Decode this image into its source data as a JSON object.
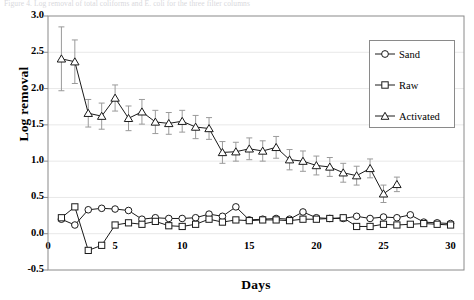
{
  "figure": {
    "top_caption": "Figure 4. Log removal of total coliforms and E. coli for the three filter columns",
    "frame_color": "#8a8a8a",
    "grid": true,
    "grid_color": "#e8e8e8",
    "series_color": "#1a1a1a",
    "errorbar_color": "#9a9a9a"
  },
  "chart_data": {
    "type": "line",
    "title": "",
    "xlabel": "Days",
    "ylabel": "Log removal",
    "xlim": [
      0,
      31
    ],
    "ylim": [
      -0.5,
      3.0
    ],
    "xticks": [
      0,
      5,
      10,
      15,
      20,
      25,
      30
    ],
    "yticks": [
      -0.5,
      0.0,
      0.5,
      1.0,
      1.5,
      2.0,
      2.5,
      3.0
    ],
    "xtick_labels": [
      "0",
      "5",
      "10",
      "15",
      "20",
      "25",
      "30"
    ],
    "ytick_labels": [
      "-0.5",
      "0.0",
      "0.5",
      "1.0",
      "1.5",
      "2.0",
      "2.5",
      "3.0"
    ],
    "grid": true,
    "legend_position": "upper right",
    "legend_entries": [
      {
        "name": "Sand",
        "marker": "circle"
      },
      {
        "name": "Raw",
        "marker": "square"
      },
      {
        "name": "Activated",
        "marker": "triangle"
      }
    ],
    "x": [
      1,
      2,
      3,
      4,
      5,
      6,
      7,
      8,
      9,
      10,
      11,
      12,
      13,
      14,
      15,
      16,
      17,
      18,
      19,
      20,
      21,
      22,
      23,
      24,
      25,
      26,
      27,
      28,
      29,
      30
    ],
    "series": [
      {
        "name": "Sand",
        "marker": "circle",
        "values": [
          0.2,
          0.12,
          0.33,
          0.35,
          0.34,
          0.32,
          0.2,
          0.22,
          0.21,
          0.21,
          0.22,
          0.27,
          0.24,
          0.37,
          0.19,
          0.2,
          0.21,
          0.2,
          0.3,
          0.22,
          0.21,
          0.21,
          0.24,
          0.21,
          0.23,
          0.22,
          0.26,
          0.16,
          0.15,
          0.14
        ],
        "errors": [
          0,
          0,
          0,
          0,
          0,
          0,
          0,
          0,
          0,
          0,
          0,
          0,
          0,
          0,
          0,
          0,
          0,
          0,
          0,
          0,
          0,
          0,
          0,
          0,
          0,
          0,
          0,
          0,
          0,
          0
        ]
      },
      {
        "name": "Raw",
        "marker": "square",
        "values": [
          0.22,
          0.37,
          -0.23,
          -0.16,
          0.12,
          0.15,
          0.13,
          0.17,
          0.11,
          0.1,
          0.13,
          0.2,
          0.16,
          0.19,
          0.18,
          0.19,
          0.19,
          0.18,
          0.2,
          0.2,
          0.21,
          0.22,
          0.1,
          0.1,
          0.13,
          0.12,
          0.13,
          0.14,
          0.13,
          0.12
        ],
        "errors": [
          0,
          0,
          0,
          0,
          0,
          0,
          0,
          0,
          0,
          0,
          0,
          0,
          0,
          0,
          0,
          0,
          0,
          0,
          0,
          0,
          0,
          0,
          0,
          0,
          0,
          0,
          0,
          0,
          0,
          0
        ]
      },
      {
        "name": "Activated",
        "marker": "triangle",
        "values": [
          2.41,
          2.37,
          1.66,
          1.62,
          1.87,
          1.59,
          1.68,
          1.54,
          1.52,
          1.55,
          1.47,
          1.45,
          1.12,
          1.13,
          1.17,
          1.14,
          1.19,
          1.02,
          1.0,
          0.94,
          0.92,
          0.84,
          0.8,
          0.9,
          0.55,
          0.68
        ],
        "errors": [
          0.44,
          0.3,
          0.19,
          0.18,
          0.18,
          0.17,
          0.17,
          0.16,
          0.15,
          0.15,
          0.16,
          0.15,
          0.15,
          0.13,
          0.15,
          0.14,
          0.15,
          0.14,
          0.14,
          0.13,
          0.13,
          0.13,
          0.13,
          0.13,
          0.12,
          0.1
        ],
        "x": [
          1,
          2,
          3,
          4,
          5,
          6,
          7,
          8,
          9,
          10,
          11,
          12,
          13,
          14,
          15,
          16,
          17,
          18,
          19,
          20,
          21,
          22,
          23,
          24,
          25,
          26
        ]
      }
    ]
  }
}
